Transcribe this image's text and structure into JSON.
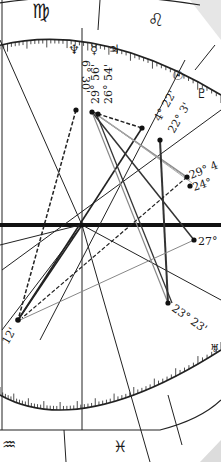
{
  "chart": {
    "signs": [
      {
        "name": "virgo",
        "glyph": "♍"
      },
      {
        "name": "leo",
        "glyph": "♌"
      },
      {
        "name": "aquarius",
        "glyph": "♒"
      },
      {
        "name": "pisces",
        "glyph": "♓"
      }
    ],
    "planets": [
      {
        "name": "neptune",
        "glyph": "♆",
        "label": "6° 30'"
      },
      {
        "name": "mercury",
        "glyph": "☿",
        "label": "29° 56'"
      },
      {
        "name": "jupiter",
        "glyph": "♃",
        "label": "26° 54'"
      },
      {
        "name": "sun",
        "glyph": "☉",
        "label": "4° 22'"
      },
      {
        "name": "pluto",
        "glyph": "♇",
        "label": "22° 3'"
      },
      {
        "name": "point-29",
        "glyph": "",
        "label": "29° 4"
      },
      {
        "name": "point-24",
        "glyph": "",
        "label": "24°"
      },
      {
        "name": "point-27",
        "glyph": "",
        "label": "27°"
      },
      {
        "name": "uranus",
        "glyph": "♅",
        "label": "23° 23'"
      },
      {
        "name": "point-12",
        "glyph": "",
        "label": "12'"
      }
    ]
  }
}
